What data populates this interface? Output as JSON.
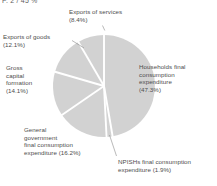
{
  "clipped_header": "P. 2 / 45 %",
  "chart_data": {
    "type": "pie",
    "title": "",
    "subtitle": "",
    "xlabel": "",
    "ylabel": "",
    "legend_position": "none",
    "grid": false,
    "units": "percent",
    "total": 100.0,
    "start_angle_deg": 0,
    "direction": "clockwise",
    "slice_color": "#d2d2d2",
    "separator_color": "#ffffff",
    "categories": [
      "Households final consumption expenditure",
      "NPISHs final consumption expenditure",
      "General government final consumption expenditure",
      "Gross capital formation",
      "Exports of goods",
      "Exports of services"
    ],
    "values": [
      47.3,
      1.9,
      16.2,
      14.1,
      12.1,
      8.4
    ],
    "slices": [
      {
        "name": "Households final consumption expenditure",
        "value": 47.3,
        "value_label": "(47.3%)",
        "color": "#d2d2d2"
      },
      {
        "name": "NPISHs final consumption expenditure",
        "value": 1.9,
        "value_label": "(1.9%)",
        "color": "#d2d2d2"
      },
      {
        "name": "General government final consumption expenditure",
        "value": 16.2,
        "value_label": "(16.2%)",
        "color": "#d2d2d2"
      },
      {
        "name": "Gross capital formation",
        "value": 14.1,
        "value_label": "(14.1%)",
        "color": "#d2d2d2"
      },
      {
        "name": "Exports of goods",
        "value": 12.1,
        "value_label": "(12.1%)",
        "color": "#d2d2d2"
      },
      {
        "name": "Exports of services",
        "value": 8.4,
        "value_label": "(8.4%)",
        "color": "#d2d2d2"
      }
    ]
  },
  "labels": {
    "exports_services": "Exports of services\n(8.4%)",
    "exports_goods": "Exports of goods\n(12.1%)",
    "gross_capital_formation": "Gross\ncapital\nformation\n(14.1%)",
    "general_government": "General\ngovernment\nfinal consumption\nexpenditure (16.2%)",
    "households": "Households final\nconsumption\nexpenditure\n(47.3%)",
    "npishs": "NPISHs final consumption\nexpenditure (1.9%)"
  }
}
